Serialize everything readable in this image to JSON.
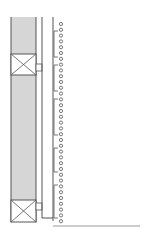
{
  "diagram": {
    "width": 147,
    "height": 235,
    "colors": {
      "background": "#ffffff",
      "stroke": "#555555",
      "fill_hatch": "#d6d6d6",
      "ground": "#9a9a9a"
    },
    "column": {
      "x": 11,
      "y": 17,
      "width": 25,
      "height": 205
    },
    "boxes": [
      {
        "name": "upper-x-box",
        "x": 11,
        "y": 54,
        "width": 25,
        "height": 21
      },
      {
        "name": "lower-x-box",
        "x": 11,
        "y": 200,
        "width": 25,
        "height": 22
      }
    ],
    "connectors": [
      {
        "x": 36,
        "y": 64,
        "width": 6,
        "height": 7
      },
      {
        "x": 36,
        "y": 203,
        "width": 6,
        "height": 7
      }
    ],
    "rails": [
      {
        "x": 42,
        "y1": 17,
        "y2": 218
      },
      {
        "x": 53,
        "y1": 17,
        "y2": 221
      }
    ],
    "brackets": [
      {
        "y1": 31,
        "y2": 57
      },
      {
        "y1": 65,
        "y2": 91
      },
      {
        "y1": 99,
        "y2": 135
      },
      {
        "y1": 148,
        "y2": 172
      },
      {
        "y1": 185,
        "y2": 218
      }
    ],
    "circles": {
      "x": 61,
      "y_start": 24,
      "y_step": 5.8,
      "count": 35,
      "radius": 1.6
    },
    "ground_line": {
      "x1": 53,
      "x2": 140,
      "y": 226
    }
  }
}
